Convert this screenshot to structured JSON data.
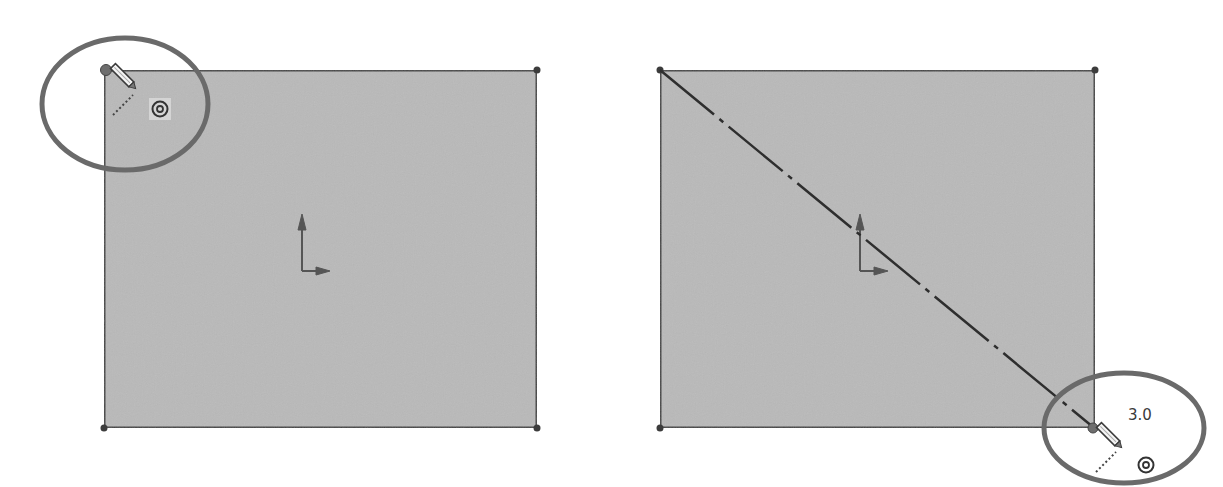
{
  "colors": {
    "sketch_fill": "#b9b9b9",
    "sketch_edge": "#454545",
    "highlight_ellipse": "#6a6a6a",
    "background": "#ffffff"
  },
  "panels": [
    {
      "id": "left",
      "description": "Rectangle sketch with pencil cursor at top-left corner",
      "rect": {
        "x": 104,
        "y": 70,
        "width": 433,
        "height": 358
      },
      "cursor": {
        "icon": "pencil-cursor-icon",
        "x": 106,
        "y": 70
      },
      "snap_icon": "concentric-circle-snap-icon",
      "highlight": {
        "cx": 125,
        "cy": 104,
        "rx": 83,
        "ry": 66
      }
    },
    {
      "id": "right",
      "description": "Rectangle sketch with diagonal centerline dragged to bottom-right corner",
      "rect": {
        "x": 660,
        "y": 70,
        "width": 435,
        "height": 358
      },
      "centerline": {
        "x1": 660,
        "y1": 70,
        "x2": 1095,
        "y2": 428
      },
      "cursor": {
        "icon": "pencil-cursor-icon",
        "x": 1093,
        "y": 428
      },
      "snap_icon": "concentric-circle-snap-icon",
      "dimension_label": "3.0",
      "highlight": {
        "cx": 1124,
        "cy": 428,
        "rx": 80,
        "ry": 55
      }
    }
  ]
}
